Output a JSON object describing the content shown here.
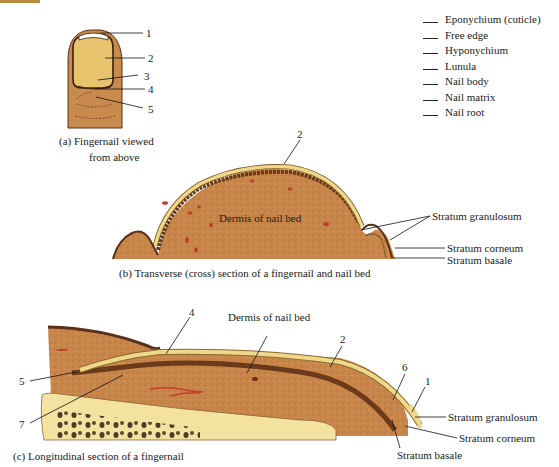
{
  "figure": {
    "panel_a": {
      "caption_line1": "(a) Fingernail viewed",
      "caption_line2": "from above",
      "numbers": [
        "1",
        "2",
        "3",
        "4",
        "5"
      ]
    },
    "word_bank": [
      "Eponychium (cuticle)",
      "Free edge",
      "Hyponychium",
      "Lunula",
      "Nail body",
      "Nail matrix",
      "Nail root"
    ],
    "panel_b": {
      "caption": "(b) Transverse (cross) section of a fingernail and nail bed",
      "number": "2",
      "labels": {
        "dermis": "Dermis of nail bed",
        "granulosum": "Stratum granulosum",
        "corneum": "Stratum corneum",
        "basale": "Stratum basale"
      }
    },
    "panel_c": {
      "caption": "(c) Longitudinal section of a fingernail",
      "numbers": {
        "n4": "4",
        "n2": "2",
        "n6": "6",
        "n1": "1",
        "n5": "5",
        "n7": "7"
      },
      "labels": {
        "dermis": "Dermis of nail bed",
        "granulosum": "Stratum granulosum",
        "corneum": "Stratum corneum",
        "basale": "Stratum basale"
      }
    },
    "colors": {
      "skin": "#c98a4e",
      "dermis": "#c8864a",
      "nail": "#f0d88a",
      "nail_dark": "#b78a3a",
      "epidermis": "#6b3a1a",
      "bone": "#f5e6a8",
      "vessel": "#b8402a"
    }
  }
}
